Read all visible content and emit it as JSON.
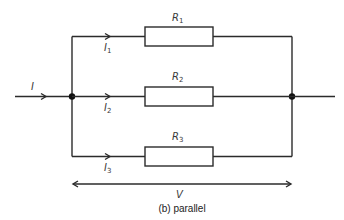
{
  "diagram": {
    "type": "parallel-circuit",
    "caption": "(b) parallel",
    "input_current": {
      "symbol": "I"
    },
    "branches": [
      {
        "current_symbol": "I",
        "current_sub": "1",
        "resistor_symbol": "R",
        "resistor_sub": "1"
      },
      {
        "current_symbol": "I",
        "current_sub": "2",
        "resistor_symbol": "R",
        "resistor_sub": "2"
      },
      {
        "current_symbol": "I",
        "current_sub": "3",
        "resistor_symbol": "R",
        "resistor_sub": "3"
      }
    ],
    "voltage": {
      "symbol": "V"
    },
    "colors": {
      "wire": "#2b2b2b",
      "text": "#3a3a3a",
      "background": "#ffffff"
    }
  }
}
